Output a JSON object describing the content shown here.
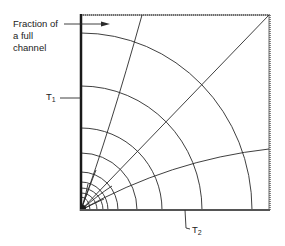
{
  "diagram": {
    "labels": {
      "fraction_line1": "Fraction of",
      "fraction_line2": "a full",
      "fraction_line3": "channel",
      "t1_main": "T",
      "t1_sub": "1",
      "t2_main": "T",
      "t2_sub": "2"
    },
    "colors": {
      "line": "#2a2a2a",
      "border": "#555555",
      "background": "#ffffff"
    },
    "geometry": {
      "origin": [
        81,
        210
      ],
      "top_right": [
        269,
        15
      ],
      "isotherm_radii_x": [
        9,
        16,
        22,
        27,
        37,
        56,
        81,
        121,
        171
      ],
      "isotherm_radii_y": [
        13,
        17,
        22,
        28,
        38,
        57,
        82,
        124,
        177
      ],
      "flux_lines": [
        "steep-to-top",
        "diagonal-45deg",
        "shallow-to-right"
      ]
    }
  }
}
